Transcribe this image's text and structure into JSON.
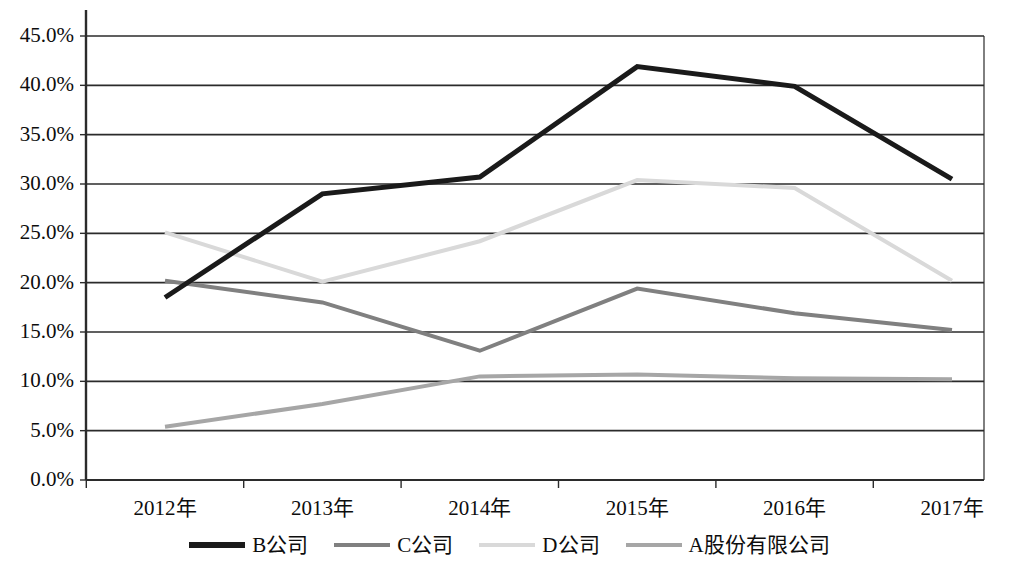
{
  "chart_data": {
    "type": "line",
    "title": "",
    "xlabel": "",
    "ylabel": "",
    "categories": [
      "2012年",
      "2013年",
      "2014年",
      "2015年",
      "2016年",
      "2017年"
    ],
    "ylim": [
      0,
      45
    ],
    "ytick_labels": [
      "0.0%",
      "5.0%",
      "10.0%",
      "15.0%",
      "20.0%",
      "25.0%",
      "30.0%",
      "35.0%",
      "40.0%",
      "45.0%"
    ],
    "ytick_values": [
      0,
      5,
      10,
      15,
      20,
      25,
      30,
      35,
      40,
      45
    ],
    "grid": true,
    "legend_position": "bottom",
    "series": [
      {
        "name": "B公司",
        "color": "#1a1a1a",
        "width": 5,
        "values": [
          18.5,
          29.0,
          30.7,
          41.9,
          39.9,
          30.5
        ]
      },
      {
        "name": "C公司",
        "color": "#808080",
        "width": 4,
        "values": [
          20.2,
          18.0,
          13.1,
          19.4,
          16.9,
          15.2
        ]
      },
      {
        "name": "D公司",
        "color": "#d9d9d9",
        "width": 4,
        "values": [
          25.1,
          20.1,
          24.2,
          30.4,
          29.6,
          20.2
        ]
      },
      {
        "name": "A股份有限公司",
        "color": "#a6a6a6",
        "width": 4,
        "values": [
          5.4,
          7.7,
          10.5,
          10.7,
          10.3,
          10.2
        ]
      }
    ]
  },
  "axes": {
    "axis_color": "#2b2b2b",
    "grid_color": "#2b2b2b"
  },
  "legend": {
    "entries": [
      {
        "label": "B公司",
        "color": "#1a1a1a"
      },
      {
        "label": "C公司",
        "color": "#808080"
      },
      {
        "label": "D公司",
        "color": "#d9d9d9"
      },
      {
        "label": "A股份有限公司",
        "color": "#a6a6a6"
      }
    ]
  }
}
